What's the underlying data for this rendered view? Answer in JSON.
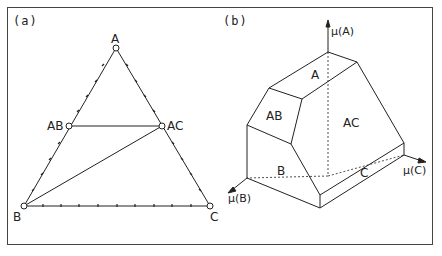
{
  "panels": {
    "a": {
      "label": "(a)",
      "vertices": {
        "A": "A",
        "AB": "AB",
        "AC": "AC",
        "B": "B",
        "C": "C"
      }
    },
    "b": {
      "label": "(b)",
      "axes": {
        "muA": "μ(A)",
        "muB": "μ(B)",
        "muC": "μ(C)"
      },
      "faces": {
        "A": "A",
        "AB": "AB",
        "AC": "AC",
        "B": "B",
        "C": "C"
      }
    }
  },
  "colors": {
    "line": "#222222",
    "frame": "#444444",
    "background": "#ffffff"
  }
}
